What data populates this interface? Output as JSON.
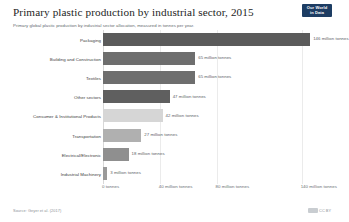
{
  "header": {
    "title": "Primary plastic production by industrial sector, 2015",
    "subtitle": "Primary global plastic production by industrial sector allocation, measured in tonnes per year."
  },
  "logo": {
    "line1": "Our World",
    "line2": "in Data"
  },
  "footer": {
    "source": "Source: Geyer et al. (2017)",
    "license": "CC BY",
    "cc_icon": "creative-commons-icon"
  },
  "chart_data": {
    "type": "bar",
    "orientation": "horizontal",
    "title": "Primary plastic production by industrial sector, 2015",
    "subtitle": "Primary global plastic production by industrial sector allocation, measured in tonnes per year.",
    "xlabel": "",
    "ylabel": "",
    "unit": "million tonnes",
    "xlim": [
      0,
      160
    ],
    "grid": true,
    "legend": false,
    "categories": [
      "Packaging",
      "Building and Construction",
      "Textiles",
      "Other sectors",
      "Consumer & Institutional Products",
      "Transportation",
      "Electrical/Electronic",
      "Industrial Machinery"
    ],
    "values": [
      146,
      65,
      65,
      47,
      42,
      27,
      18,
      3
    ],
    "value_labels": [
      "146 million tonnes",
      "65 million tonnes",
      "65 million tonnes",
      "47 million tonnes",
      "42 million tonnes",
      "27 million tonnes",
      "18 million tonnes",
      "3 million tonnes"
    ],
    "bar_colors": [
      "#5b5b5b",
      "#6e6e6e",
      "#6e6e6e",
      "#5f5f5f",
      "#d6d6d6",
      "#b0b0b0",
      "#8f8f8f",
      "#9a9a9a"
    ],
    "ticks": [
      {
        "label": "0 tonnes",
        "value": 0
      },
      {
        "label": "40 million tonnes",
        "value": 40
      },
      {
        "label": "80 million tonnes",
        "value": 80
      },
      {
        "label": "140 million tonnes",
        "value": 140
      }
    ]
  }
}
